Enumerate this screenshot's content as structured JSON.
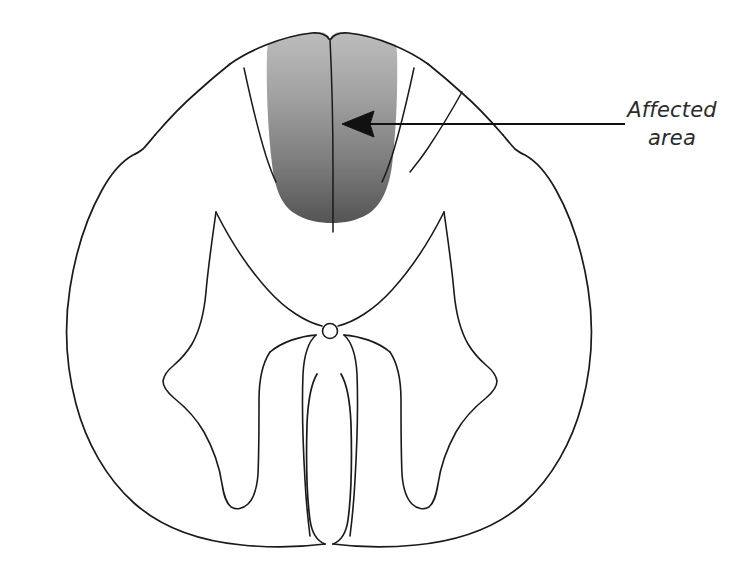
{
  "figure": {
    "name": "spinal-cord-cross-section",
    "background_color": "#ffffff",
    "outline_color": "#1a1a1a",
    "outline_width": 1.6
  },
  "annotation": {
    "label_line_1": "Affected",
    "label_line_2": "area",
    "full_text": "Affected area",
    "text_color": "#2b2b2b",
    "leader_line": {
      "from_x": 625,
      "from_y": 124,
      "to_x": 345,
      "to_y": 124,
      "color": "#111111",
      "width": 2.2
    },
    "arrow_head": {
      "tip_x": 342,
      "tip_y": 124,
      "color": "#111111"
    }
  },
  "shaded_region": {
    "name": "dorsal-columns",
    "label": "Affected area",
    "gradient_top_color": "#b9b9b9",
    "gradient_bottom_color": "#565656",
    "gradient_mid_color": "#8d8d8d"
  },
  "structures": [
    {
      "name": "outer-boundary",
      "label": "Spinal cord outer margin",
      "stroke": "#1a1a1a"
    },
    {
      "name": "gray-matter-butterfly",
      "label": "Gray matter (butterfly)",
      "stroke": "#1a1a1a"
    },
    {
      "name": "central-canal",
      "label": "Central canal",
      "stroke": "#1a1a1a",
      "cx": 330,
      "cy": 331,
      "r": 7
    },
    {
      "name": "posterior-median-septum",
      "label": "Posterior median septum",
      "stroke": "#1a1a1a"
    },
    {
      "name": "dorsal-intermediate-sulcus-left",
      "label": "Left dorsal intermediate sulcus",
      "stroke": "#1a1a1a"
    },
    {
      "name": "dorsal-intermediate-sulcus-right",
      "label": "Right dorsal intermediate sulcus",
      "stroke": "#1a1a1a"
    },
    {
      "name": "anterior-median-fissure",
      "label": "Anterior median fissure",
      "stroke": "#1a1a1a"
    }
  ]
}
